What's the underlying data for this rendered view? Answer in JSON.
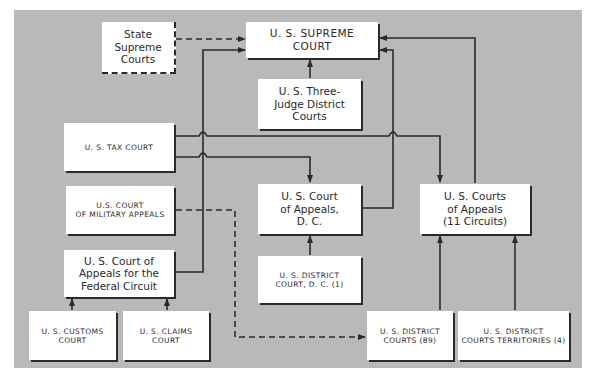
{
  "diagram": {
    "colors": {
      "background": "#b9b9b9",
      "box": "#ffffff",
      "line": "#2a2a2a"
    },
    "nodes": {
      "state_supreme": {
        "label": "State\nSupreme\nCourts"
      },
      "us_supreme": {
        "label": "U. S. SUPREME\nCOURT"
      },
      "three_judge": {
        "label": "U. S. Three-\nJudge District\nCourts"
      },
      "tax_court": {
        "label": "U. S. TAX COURT"
      },
      "military_appeals": {
        "label": "U.S. COURT\nOF MILITARY APPEALS"
      },
      "federal_circuit": {
        "label": "U. S. Court of\nAppeals for the\nFederal Circuit"
      },
      "customs_court": {
        "label": "U. S. CUSTOMS\nCOURT"
      },
      "claims_court": {
        "label": "U. S. CLAIMS\nCOURT"
      },
      "appeals_dc": {
        "label": "U. S. Court\nof Appeals,\nD. C."
      },
      "courts_of_appeals": {
        "label": "U. S. Courts\nof Appeals\n(11 Circuits)"
      },
      "district_dc": {
        "label": "U. S. DISTRICT\nCOURT, D. C. (1)"
      },
      "district_courts": {
        "label": "U. S. DISTRICT\nCOURTS (89)"
      },
      "district_territories": {
        "label": "U. S. DISTRICT\nCOURTS TERRITORIES (4)"
      }
    },
    "edges": [
      {
        "from": "state_supreme",
        "to": "us_supreme",
        "style": "dashed"
      },
      {
        "from": "three_judge",
        "to": "us_supreme",
        "style": "solid"
      },
      {
        "from": "federal_circuit",
        "to": "us_supreme",
        "style": "solid"
      },
      {
        "from": "appeals_dc",
        "to": "us_supreme",
        "style": "solid"
      },
      {
        "from": "courts_of_appeals",
        "to": "us_supreme",
        "style": "solid"
      },
      {
        "from": "tax_court",
        "to": "courts_of_appeals",
        "style": "solid"
      },
      {
        "from": "tax_court",
        "to": "appeals_dc",
        "style": "solid"
      },
      {
        "from": "district_dc",
        "to": "appeals_dc",
        "style": "solid"
      },
      {
        "from": "district_courts",
        "to": "courts_of_appeals",
        "style": "solid"
      },
      {
        "from": "district_territories",
        "to": "courts_of_appeals",
        "style": "solid"
      },
      {
        "from": "customs_court",
        "to": "federal_circuit",
        "style": "solid"
      },
      {
        "from": "claims_court",
        "to": "federal_circuit",
        "style": "solid"
      },
      {
        "from": "military_appeals",
        "to": "district_courts",
        "style": "dashed"
      }
    ]
  }
}
